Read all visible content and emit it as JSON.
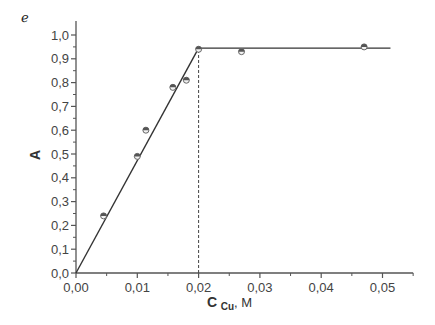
{
  "stray_mark": "ℯ",
  "chart_data": {
    "type": "scatter",
    "title": "",
    "xlabel": "C Cu, M",
    "xlabel_main": "C",
    "xlabel_sub": "Cu",
    "xlabel_unit": ", M",
    "ylabel": "A",
    "xlim": [
      0.0,
      0.055
    ],
    "ylim": [
      0.0,
      1.05
    ],
    "grid": false,
    "legend": null,
    "x_ticks": [
      0.0,
      0.01,
      0.02,
      0.03,
      0.04,
      0.05
    ],
    "x_tick_labels": [
      "0,00",
      "0,01",
      "0,02",
      "0,03",
      "0,04",
      "0,05"
    ],
    "y_ticks": [
      0.0,
      0.1,
      0.2,
      0.3,
      0.4,
      0.5,
      0.6,
      0.7,
      0.8,
      0.9,
      1.0
    ],
    "y_tick_labels": [
      "0,0",
      "0,1",
      "0,2",
      "0,3",
      "0,4",
      "0,5",
      "0,6",
      "0,7",
      "0,8",
      "0,9",
      "1,0"
    ],
    "series": [
      {
        "name": "measured",
        "type": "scatter",
        "x": [
          0.0045,
          0.01,
          0.0114,
          0.0158,
          0.018,
          0.02,
          0.027,
          0.047
        ],
        "y": [
          0.24,
          0.49,
          0.6,
          0.78,
          0.81,
          0.94,
          0.93,
          0.95
        ]
      },
      {
        "name": "linear fit (rising)",
        "type": "line",
        "x": [
          0.0,
          0.02
        ],
        "y": [
          0.0,
          0.945
        ]
      },
      {
        "name": "plateau",
        "type": "line",
        "x": [
          0.02,
          0.0513
        ],
        "y": [
          0.945,
          0.945
        ]
      },
      {
        "name": "equivalence marker",
        "type": "dashed-vertical",
        "x": [
          0.02,
          0.02
        ],
        "y": [
          0.0,
          0.945
        ]
      }
    ],
    "annotations": []
  }
}
